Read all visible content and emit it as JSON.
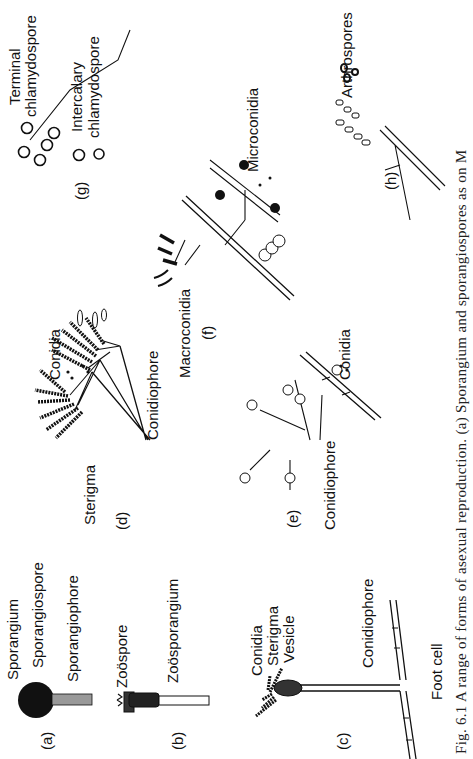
{
  "figure": {
    "caption": "Fig. 6.1  A range of forms of asexual reproduction. (a) Sporangium and sporangiospores as on M",
    "orientation": "rotated 90° counter-clockwise",
    "panels": [
      {
        "id": "a",
        "label": "(a)",
        "labels": [
          "Sporangium",
          "Sporangiospore",
          "Sporangiophore"
        ]
      },
      {
        "id": "b",
        "label": "(b)",
        "labels": [
          "Zoöspore",
          "Zoösporangium"
        ]
      },
      {
        "id": "c",
        "label": "(c)",
        "labels": [
          "Conidia",
          "Sterigma",
          "Vesicle",
          "Conidiophore",
          "Foot cell"
        ]
      },
      {
        "id": "d",
        "label": "(d)",
        "labels": [
          "Sterigma",
          "Conidia",
          "Conidiophore"
        ]
      },
      {
        "id": "e",
        "label": "(e)",
        "labels": [
          "Conidiophore",
          "Conidia"
        ]
      },
      {
        "id": "f",
        "label": "(f)",
        "labels": [
          "Macroconidia",
          "Microconidia"
        ]
      },
      {
        "id": "g",
        "label": "(g)",
        "labels": [
          "Terminal",
          "chlamydospore",
          "Intercalary",
          "chlamydospore"
        ]
      },
      {
        "id": "h",
        "label": "(h)",
        "labels": [
          "Arthrospores"
        ]
      }
    ]
  },
  "colors": {
    "ink": "#111111",
    "paper": "#ffffff"
  }
}
